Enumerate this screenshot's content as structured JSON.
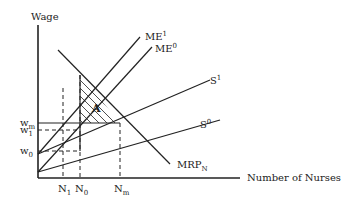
{
  "axes": {
    "y_label": "Wage",
    "x_label": "Number of Nurses"
  },
  "curves": {
    "me1": {
      "label": "ME",
      "sup": "1"
    },
    "me0": {
      "label": "ME",
      "sup": "0"
    },
    "s1": {
      "label": "S",
      "sup": "1"
    },
    "s0": {
      "label": "S",
      "sup": "0"
    },
    "mrp": {
      "label": "MRP",
      "sub": "N"
    }
  },
  "y_ticks": {
    "w1": {
      "label": "w",
      "sub": "1"
    },
    "wm": {
      "label": "w",
      "sub": "m"
    },
    "w0": {
      "label": "w",
      "sub": "0"
    }
  },
  "x_ticks": {
    "n1": {
      "label": "N",
      "sub": "1"
    },
    "n0": {
      "label": "N",
      "sub": "0"
    },
    "nm": {
      "label": "N",
      "sub": "m"
    }
  },
  "area_label": "A"
}
